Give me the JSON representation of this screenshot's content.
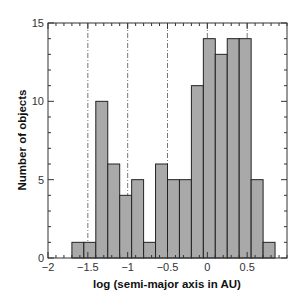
{
  "chart_data": {
    "type": "bar",
    "title": "",
    "xlabel": "log (semi-major axis in AU)",
    "ylabel": "Number of objects",
    "xlim": [
      -2,
      1
    ],
    "ylim": [
      0,
      15
    ],
    "grid": false,
    "bin_width": 0.15,
    "bin_starts": [
      -1.7,
      -1.55,
      -1.4,
      -1.25,
      -1.1,
      -0.95,
      -0.8,
      -0.65,
      -0.5,
      -0.35,
      -0.2,
      -0.05,
      0.1,
      0.25,
      0.4,
      0.55,
      0.7
    ],
    "values": [
      1,
      1,
      10,
      6,
      4,
      5,
      1,
      6,
      5,
      5,
      11,
      14,
      13,
      14,
      14,
      5,
      1
    ],
    "x_ticks": [
      -2,
      -1.5,
      -1,
      -0.5,
      0,
      0.5
    ],
    "x_tick_labels": [
      "−2",
      "−1.5",
      "−1",
      "−0.5",
      "0",
      "0.5"
    ],
    "x_minor_step": 0.1,
    "y_ticks": [
      0,
      5,
      10,
      15
    ],
    "y_tick_labels": [
      "0",
      "5",
      "10",
      "15"
    ],
    "y_minor_step": 1,
    "reference_lines_x": [
      -1.5,
      -1,
      -0.5,
      0,
      0.5
    ],
    "reference_line_style": "dash-dot",
    "bar_color": "#a9a9a9"
  }
}
